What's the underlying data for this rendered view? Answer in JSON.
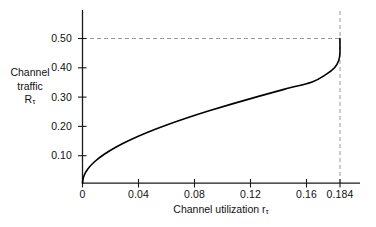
{
  "chart_data": {
    "type": "line",
    "title": "",
    "xlabel": "Channel utilization rτ",
    "ylabel": "Channel traffic Rτ",
    "xlabel_main": "Channel utilization r",
    "xlabel_sub": "τ",
    "ylabel_line1": "Channel",
    "ylabel_line2": "traffic",
    "ylabel_line3_main": "R",
    "ylabel_line3_sub": "τ",
    "xlim": [
      0,
      0.2
    ],
    "ylim": [
      0,
      0.56
    ],
    "xticks": [
      0,
      0.04,
      0.08,
      0.12,
      0.16,
      0.184
    ],
    "xticklabels": [
      "0",
      "0.04",
      "0.08",
      "0.12",
      "0.16",
      "0.184"
    ],
    "yticks": [
      0.1,
      0.2,
      0.3,
      0.4,
      0.5
    ],
    "yticklabels": [
      "0.10",
      "0.20",
      "0.30",
      "0.40",
      "0.50"
    ],
    "grid": false,
    "legend": null,
    "series": [
      {
        "name": "Channel traffic vs channel utilization",
        "x": [
          0.0,
          0.00098,
          0.00392,
          0.00879,
          0.01552,
          0.02407,
          0.03433,
          0.04622,
          0.05963,
          0.07443,
          0.09048,
          0.10763,
          0.12574,
          0.14462,
          0.16409,
          0.17377,
          0.18024,
          0.18315,
          0.18394,
          0.1839397
        ],
        "y": [
          0.0,
          0.025,
          0.05,
          0.075,
          0.1,
          0.125,
          0.15,
          0.175,
          0.2,
          0.225,
          0.25,
          0.275,
          0.3,
          0.325,
          0.35,
          0.375,
          0.4,
          0.425,
          0.45,
          0.5
        ]
      }
    ],
    "annotations": [
      {
        "name": "max-throughput-horizontal-guide",
        "type": "dashed-horizontal-line",
        "y": 0.5,
        "x_from": 0.0,
        "x_to": 0.184,
        "color": "#999999"
      },
      {
        "name": "max-throughput-vertical-guide",
        "type": "dashed-vertical-line",
        "x": 0.184,
        "y_from": 0.0,
        "y_to": 0.56,
        "color": "#999999"
      }
    ],
    "colors": {
      "curve": "#000000",
      "axis": "#1a1a1a",
      "guide": "#999999",
      "background": "#ffffff",
      "text": "#111111"
    }
  }
}
